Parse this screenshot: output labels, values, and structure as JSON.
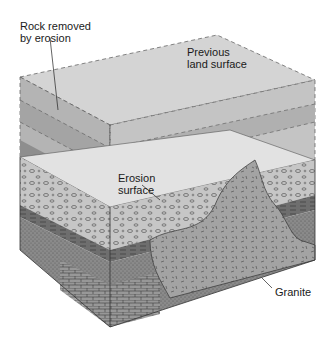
{
  "diagram": {
    "type": "geologic block diagram",
    "labels": {
      "rock_removed_line1": "Rock removed",
      "rock_removed_line2": "by erosion",
      "previous_line1": "Previous",
      "previous_line2": "land surface",
      "erosion_line1": "Erosion",
      "erosion_line2": "surface",
      "granite": "Granite"
    },
    "colors": {
      "ghost_top": "#d4d4d4",
      "ghost_band_dark": "#a9a9a9",
      "ghost_band_mid": "#bdbdbd",
      "erosion_surface_light": "#e3e3e3",
      "conglomerate": "#c9c9c9",
      "shale": "#6f6f6f",
      "sandstone": "#8a8a8a",
      "limestone": "#9a9a9a",
      "granite": "#a6a6a6",
      "outline": "#333333"
    }
  }
}
